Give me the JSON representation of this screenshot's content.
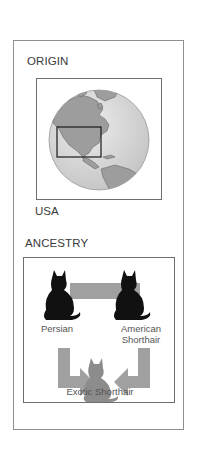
{
  "origin": {
    "heading": "ORIGIN",
    "country": "USA",
    "map": {
      "type": "globe",
      "highlight_region": "USA",
      "colors": {
        "ocean": "#d9d9d9",
        "land": "#9a9a9a",
        "highlight_box": "#1a1a1a"
      }
    }
  },
  "ancestry": {
    "heading": "ANCESTRY",
    "parents": [
      {
        "name": "Persian",
        "icon": "cat-silhouette-icon"
      },
      {
        "name_line1": "American",
        "name_line2": "Shorthair",
        "icon": "cat-silhouette-icon"
      }
    ],
    "offspring": {
      "name": "Exotic Shorthair",
      "icon": "cat-silhouette-gray-icon"
    },
    "colors": {
      "parent_cat": "#111111",
      "offspring_cat": "#8c8c8c",
      "arrow": "#a0a0a0"
    }
  }
}
